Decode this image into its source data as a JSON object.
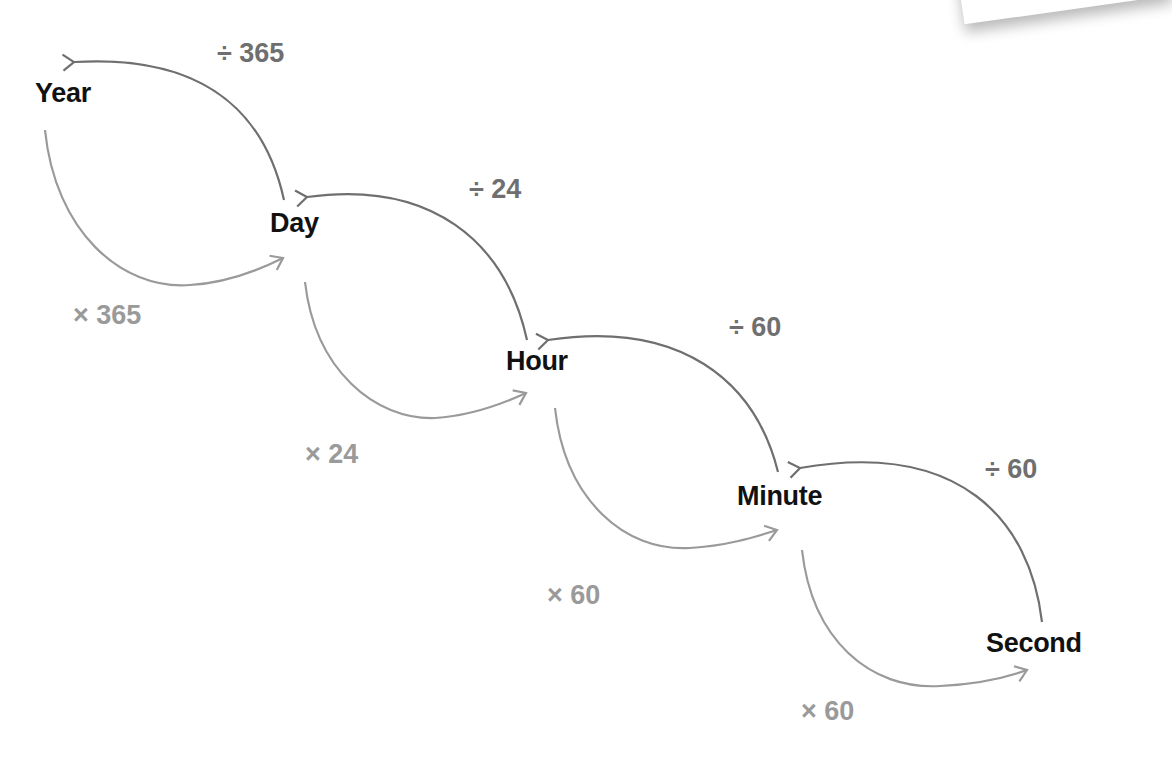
{
  "diagram": {
    "title": "",
    "colors": {
      "unit_text": "#111111",
      "divide_arrow": "#6f6f6f",
      "multiply_arrow": "#9a9a9a"
    },
    "units": [
      {
        "id": "year",
        "label": "Year"
      },
      {
        "id": "day",
        "label": "Day"
      },
      {
        "id": "hour",
        "label": "Hour"
      },
      {
        "id": "minute",
        "label": "Minute"
      },
      {
        "id": "second",
        "label": "Second"
      }
    ],
    "conversions": [
      {
        "from": "Year",
        "to": "Day",
        "multiply_label": "× 365",
        "divide_label": "÷ 365"
      },
      {
        "from": "Day",
        "to": "Hour",
        "multiply_label": "× 24",
        "divide_label": "÷ 24"
      },
      {
        "from": "Hour",
        "to": "Minute",
        "multiply_label": "× 60",
        "divide_label": "÷ 60"
      },
      {
        "from": "Minute",
        "to": "Second",
        "multiply_label": "× 60",
        "divide_label": "÷ 60"
      }
    ]
  }
}
